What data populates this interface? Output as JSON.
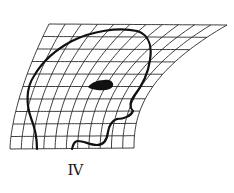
{
  "figure": {
    "type": "coordinate-transformation-grid",
    "label": "IV",
    "colors": {
      "background": "#ffffff",
      "grid": "#2a2a2a",
      "outline": "#111111"
    },
    "grid": {
      "rows": 10,
      "columns": 11,
      "corners": {
        "top_left": [
          49,
          24
        ],
        "top_right": [
          227,
          25
        ],
        "bottom_left": [
          10,
          149
        ],
        "bottom_right": [
          134,
          148
        ]
      }
    },
    "elements": [
      "grid",
      "head-outline",
      "jaw-outline",
      "eye-blob",
      "figure-label"
    ]
  }
}
